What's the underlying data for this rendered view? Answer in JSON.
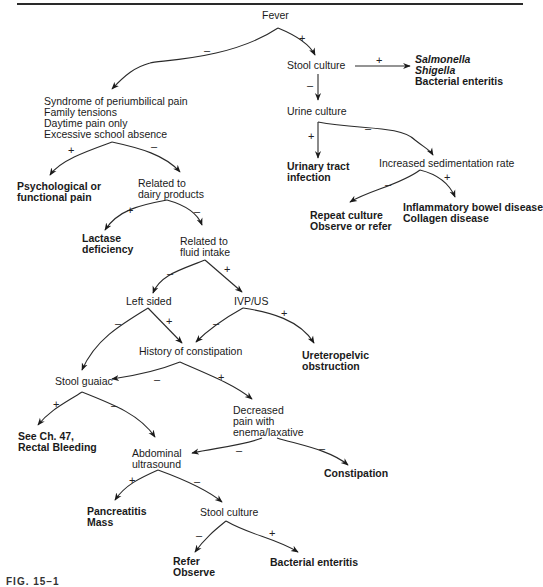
{
  "figure": {
    "caption_fragment": "FIG. 15–1"
  },
  "nodes": {
    "fever": "Fever",
    "stool_culture_top": "Stool culture",
    "salmonella": "Salmonella",
    "shigella": "Shigella",
    "bacterial_enteritis_top": "Bacterial enteritis",
    "urine_culture": "Urine culture",
    "uti_line1": "Urinary tract",
    "uti_line2": "infection",
    "esr": "Increased sedimentation rate",
    "repeat_line1": "Repeat culture",
    "repeat_line2": "Observe or refer",
    "ibd_line1": "Inflammatory bowel disease",
    "ibd_line2": "Collagen disease",
    "syndrome_line1": "Syndrome of periumbilical pain",
    "syndrome_line2": "Family tensions",
    "syndrome_line3": "Daytime pain only",
    "syndrome_line4": "Excessive school absence",
    "psych_line1": "Psychological or",
    "psych_line2": "functional pain",
    "dairy_line1": "Related to",
    "dairy_line2": "dairy products",
    "lactase_line1": "Lactase",
    "lactase_line2": "deficiency",
    "fluid_line1": "Related to",
    "fluid_line2": "fluid intake",
    "left_sided": "Left sided",
    "ivp_us": "IVP/US",
    "upj_line1": "Ureteropelvic",
    "upj_line2": "obstruction",
    "constipation_hx": "History of constipation",
    "stool_guaiac": "Stool guaiac",
    "decreased_line1": "Decreased",
    "decreased_line2": "pain with",
    "decreased_line3": "enema/laxative",
    "see_ch_line1": "See Ch. 47,",
    "see_ch_line2": "Rectal Bleeding",
    "abd_us_line1": "Abdominal",
    "abd_us_line2": "ultrasound",
    "constipation": "Constipation",
    "pancreatitis_line1": "Pancreatitis",
    "pancreatitis_line2": "Mass",
    "stool_culture_bottom": "Stool culture",
    "refer_line1": "Refer",
    "refer_line2": "Observe",
    "bacterial_enteritis_bottom": "Bacterial enteritis"
  },
  "edge_labels": {
    "fever_neg": "–",
    "fever_pos": "+",
    "stool_top_pos": "+",
    "stool_top_neg": "–",
    "urine_pos": "+",
    "urine_neg": "–",
    "esr_neg": "–",
    "esr_pos": "+",
    "syndrome_pos": "+",
    "syndrome_neg": "–",
    "dairy_pos": "+",
    "dairy_neg": "–",
    "fluid_neg": "–",
    "fluid_pos": "+",
    "left_neg": "–",
    "left_pos": "+",
    "ivp_neg": "–",
    "ivp_pos": "+",
    "hx_neg": "–",
    "hx_pos": "+",
    "guaiac_pos": "+",
    "guaiac_neg": "–",
    "decreased_neg_left": "–",
    "decreased_neg_right": "–",
    "abd_pos": "+",
    "abd_neg": "–",
    "stool_bottom_neg": "–",
    "stool_bottom_pos": "+"
  }
}
